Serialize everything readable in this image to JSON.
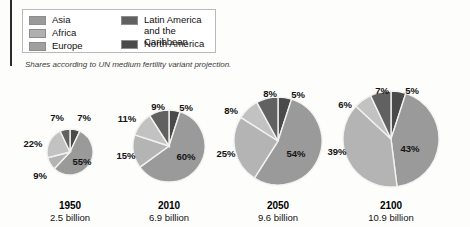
{
  "caption": "Shares according to UN medium fertility variant projection.",
  "legend": {
    "column1": [
      {
        "label": "Asia",
        "color": "#9a9a9a",
        "key": "asia"
      },
      {
        "label": "Africa",
        "color": "#b0b0b0",
        "key": "africa"
      },
      {
        "label": "Europe",
        "color": "#9f9f9f",
        "key": "europe"
      }
    ],
    "column2": [
      {
        "label": "Latin America\nand the Caribbean",
        "color": "#616161",
        "key": "latin-america"
      },
      {
        "label": "North America",
        "color": "#4a4a4a",
        "key": "north-america"
      }
    ]
  },
  "colors": {
    "asia": "#9a9a9a",
    "africa": "#b4b4b4",
    "europe": "#c2c2c2",
    "latin_america": "#616161",
    "north_america": "#4a4a4a",
    "slice_border": "#f2f2f0",
    "legend_border": "#b9b9b9",
    "rule": "#2b2b2b"
  },
  "chart_data": {
    "type": "pie",
    "title": "",
    "legend_position": "top-left",
    "note": "Shares according to UN medium fertility variant projection.",
    "regions": [
      "North America",
      "Asia",
      "Africa",
      "Europe",
      "Latin America and the Caribbean"
    ],
    "charts": [
      {
        "year": "1950",
        "population": "2.5 billion",
        "population_value": 2.5,
        "radius_px": 23,
        "cx": 70,
        "cy": 152,
        "slices": [
          {
            "region": "North America",
            "value": 7,
            "label": "7%",
            "color": "#4a4a4a",
            "label_x": 84,
            "label_y": 117,
            "inside": false
          },
          {
            "region": "Asia",
            "value": 55,
            "label": "55%",
            "color": "#9a9a9a",
            "label_x": 82,
            "label_y": 161,
            "inside": true
          },
          {
            "region": "Africa",
            "value": 9,
            "label": "9%",
            "color": "#b4b4b4",
            "label_x": 40,
            "label_y": 175,
            "inside": false
          },
          {
            "region": "Europe",
            "value": 22,
            "label": "22%",
            "color": "#c2c2c2",
            "label_x": 33,
            "label_y": 143,
            "inside": false
          },
          {
            "region": "Latin America and the Caribbean",
            "value": 7,
            "label": "7%",
            "color": "#616161",
            "label_x": 57,
            "label_y": 117,
            "inside": false
          }
        ]
      },
      {
        "year": "2010",
        "population": "6.9 billion",
        "population_value": 6.9,
        "radius_px": 36,
        "cx": 169,
        "cy": 146,
        "slices": [
          {
            "region": "North America",
            "value": 5,
            "label": "5%",
            "color": "#4a4a4a",
            "label_x": 186,
            "label_y": 107,
            "inside": false
          },
          {
            "region": "Asia",
            "value": 60,
            "label": "60%",
            "color": "#9a9a9a",
            "label_x": 186,
            "label_y": 156,
            "inside": true
          },
          {
            "region": "Africa",
            "value": 15,
            "label": "15%",
            "color": "#b4b4b4",
            "label_x": 126,
            "label_y": 155,
            "inside": false
          },
          {
            "region": "Europe",
            "value": 11,
            "label": "11%",
            "color": "#c2c2c2",
            "label_x": 127,
            "label_y": 118,
            "inside": false
          },
          {
            "region": "Latin America and the Caribbean",
            "value": 9,
            "label": "9%",
            "color": "#616161",
            "label_x": 158,
            "label_y": 106,
            "inside": false
          }
        ]
      },
      {
        "year": "2050",
        "population": "9.6 billion",
        "population_value": 9.6,
        "radius_px": 44,
        "cx": 278,
        "cy": 141,
        "slices": [
          {
            "region": "North America",
            "value": 5,
            "label": "5%",
            "color": "#4a4a4a",
            "label_x": 298,
            "label_y": 94,
            "inside": false
          },
          {
            "region": "Asia",
            "value": 54,
            "label": "54%",
            "color": "#9a9a9a",
            "label_x": 296,
            "label_y": 153,
            "inside": true
          },
          {
            "region": "Africa",
            "value": 25,
            "label": "25%",
            "color": "#b4b4b4",
            "label_x": 226,
            "label_y": 153,
            "inside": false
          },
          {
            "region": "Europe",
            "value": 8,
            "label": "8%",
            "color": "#c2c2c2",
            "label_x": 231,
            "label_y": 110,
            "inside": false
          },
          {
            "region": "Latin America and the Caribbean",
            "value": 8,
            "label": "8%",
            "color": "#616161",
            "label_x": 270,
            "label_y": 93,
            "inside": false
          }
        ]
      },
      {
        "year": "2100",
        "population": "10.9 billion",
        "population_value": 10.9,
        "radius_px": 48,
        "cx": 391,
        "cy": 139,
        "slices": [
          {
            "region": "North America",
            "value": 5,
            "label": "5%",
            "color": "#4a4a4a",
            "label_x": 412,
            "label_y": 90,
            "inside": false
          },
          {
            "region": "Asia",
            "value": 43,
            "label": "43%",
            "color": "#9a9a9a",
            "label_x": 410,
            "label_y": 148,
            "inside": true
          },
          {
            "region": "Africa",
            "value": 39,
            "label": "39%",
            "color": "#b4b4b4",
            "label_x": 337,
            "label_y": 151,
            "inside": false
          },
          {
            "region": "Europe",
            "value": 6,
            "label": "6%",
            "color": "#c2c2c2",
            "label_x": 345,
            "label_y": 104,
            "inside": false
          },
          {
            "region": "Latin America and the Caribbean",
            "value": 7,
            "label": "7%",
            "color": "#616161",
            "label_x": 382,
            "label_y": 90,
            "inside": false
          }
        ]
      }
    ]
  },
  "labels": {
    "year_y": 200,
    "pop_y": 212
  }
}
